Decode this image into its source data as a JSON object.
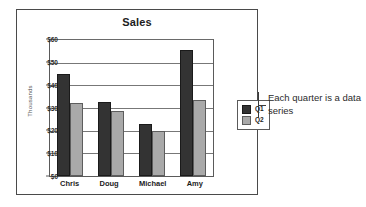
{
  "chart_data": {
    "type": "bar",
    "title": "Sales",
    "xlabel": "",
    "ylabel": "Thousands",
    "categories": [
      "Chris",
      "Doug",
      "Michael",
      "Amy"
    ],
    "series": [
      {
        "name": "Q1",
        "values": [
          45.5,
          33,
          23,
          56
        ],
        "color": "#333333"
      },
      {
        "name": "Q2",
        "values": [
          32.5,
          29,
          20,
          34
        ],
        "color": "#a9a9a9"
      }
    ],
    "ylim": [
      0,
      60
    ],
    "yticks": [
      60,
      50,
      40,
      30,
      20,
      10,
      0
    ],
    "ytick_labels": [
      "$60",
      "$50",
      "$40",
      "$30",
      "$20",
      "$10",
      "$0"
    ],
    "grid": true,
    "legend_position": "right"
  },
  "annotation": {
    "text": "Each quarter is a data series"
  }
}
